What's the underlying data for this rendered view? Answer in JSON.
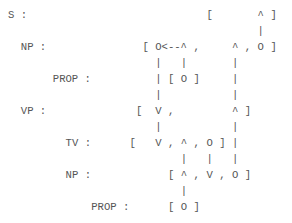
{
  "layout": {
    "origin_x": 8,
    "origin_y": 7,
    "char_width": 6.4,
    "line_height": 16,
    "text_color": "#555555"
  },
  "diagram": {
    "type": "ascii-parse-tree",
    "rows": [
      {
        "label": "S :",
        "label_col": 0,
        "glyphs": [
          {
            "c": "[",
            "col": 31
          },
          {
            "c": "^",
            "col": 39
          },
          {
            "c": "]",
            "col": 41
          }
        ]
      },
      {
        "label": "",
        "label_col": 0,
        "glyphs": [
          {
            "c": "|",
            "col": 39
          }
        ]
      },
      {
        "label": "NP :",
        "label_col": 2,
        "glyphs": [
          {
            "c": "[",
            "col": 21
          },
          {
            "c": "O<--^",
            "col": 23
          },
          {
            "c": ",",
            "col": 29
          },
          {
            "c": "^",
            "col": 35
          },
          {
            "c": ",",
            "col": 37
          },
          {
            "c": "O",
            "col": 39
          },
          {
            "c": "]",
            "col": 41
          }
        ]
      },
      {
        "label": "",
        "label_col": 0,
        "glyphs": [
          {
            "c": "|",
            "col": 23
          },
          {
            "c": "|",
            "col": 27
          },
          {
            "c": "|",
            "col": 35
          }
        ]
      },
      {
        "label": "PROP :",
        "label_col": 7,
        "glyphs": [
          {
            "c": "|",
            "col": 23
          },
          {
            "c": "[",
            "col": 25
          },
          {
            "c": "O",
            "col": 27
          },
          {
            "c": "]",
            "col": 29
          },
          {
            "c": "|",
            "col": 35
          }
        ]
      },
      {
        "label": "",
        "label_col": 0,
        "glyphs": [
          {
            "c": "|",
            "col": 23
          },
          {
            "c": "|",
            "col": 35
          }
        ]
      },
      {
        "label": "VP :",
        "label_col": 2,
        "glyphs": [
          {
            "c": "[",
            "col": 20
          },
          {
            "c": "V",
            "col": 23
          },
          {
            "c": ",",
            "col": 25
          },
          {
            "c": "^",
            "col": 35
          },
          {
            "c": "]",
            "col": 37
          }
        ]
      },
      {
        "label": "",
        "label_col": 0,
        "glyphs": [
          {
            "c": "|",
            "col": 23
          },
          {
            "c": "|",
            "col": 35
          }
        ]
      },
      {
        "label": "TV :",
        "label_col": 9,
        "glyphs": [
          {
            "c": "[",
            "col": 19
          },
          {
            "c": "V",
            "col": 23
          },
          {
            "c": ",",
            "col": 25
          },
          {
            "c": "^",
            "col": 27
          },
          {
            "c": ",",
            "col": 29
          },
          {
            "c": "O",
            "col": 31
          },
          {
            "c": "]",
            "col": 33
          },
          {
            "c": "|",
            "col": 35
          }
        ]
      },
      {
        "label": "",
        "label_col": 0,
        "glyphs": [
          {
            "c": "|",
            "col": 27
          },
          {
            "c": "|",
            "col": 31
          },
          {
            "c": "|",
            "col": 35
          }
        ]
      },
      {
        "label": "NP :",
        "label_col": 9,
        "glyphs": [
          {
            "c": "[",
            "col": 25
          },
          {
            "c": "^",
            "col": 27
          },
          {
            "c": ",",
            "col": 29
          },
          {
            "c": "V",
            "col": 31
          },
          {
            "c": ",",
            "col": 33
          },
          {
            "c": "O",
            "col": 35
          },
          {
            "c": "]",
            "col": 37
          }
        ]
      },
      {
        "label": "",
        "label_col": 0,
        "glyphs": [
          {
            "c": "|",
            "col": 27
          }
        ]
      },
      {
        "label": "PROP :",
        "label_col": 13,
        "glyphs": [
          {
            "c": "[",
            "col": 25
          },
          {
            "c": "O",
            "col": 27
          },
          {
            "c": "]",
            "col": 29
          }
        ]
      }
    ]
  }
}
